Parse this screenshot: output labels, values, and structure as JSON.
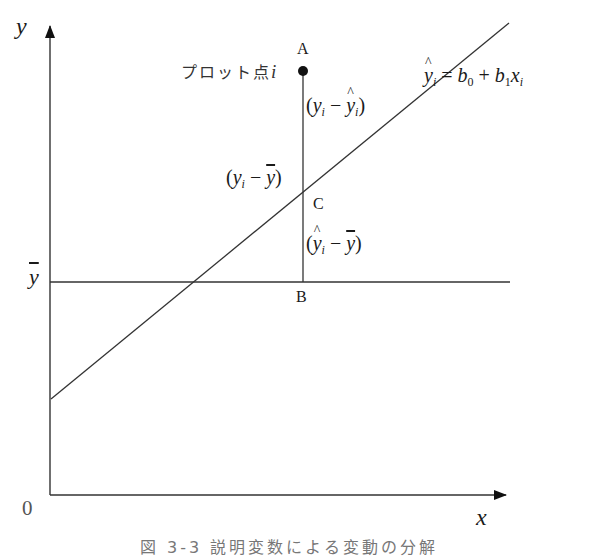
{
  "diagram": {
    "type": "regression-deviation-decomposition",
    "axes": {
      "x_label": "x",
      "y_label": "y",
      "origin_label": "0",
      "ybar_label": "y"
    },
    "points": {
      "A": "A",
      "B": "B",
      "C": "C"
    },
    "plot_point_label": {
      "text": "プロット点",
      "index": "i"
    },
    "deviations": {
      "residual": {
        "open": "(",
        "y": "y",
        "sub": "i",
        "minus": " − ",
        "yhat": "y",
        "sub2": "i",
        "close": ")"
      },
      "total": {
        "open": "(",
        "y": "y",
        "sub": "i",
        "minus": " − ",
        "ybar": "y",
        "close": ")"
      },
      "explained": {
        "open": "(",
        "yhat": "y",
        "sub": "i",
        "minus": " − ",
        "ybar": "y",
        "close": ")"
      }
    },
    "regression_equation": {
      "lhs": "y",
      "lhs_sub": "i",
      "eq": " = ",
      "b0": "b",
      "b0_sub": "0",
      "plus": " + ",
      "b1": "b",
      "b1_sub": "1",
      "x": "x",
      "x_sub": "i"
    },
    "caption": "図 3-3  説明変数による変動の分解"
  },
  "geometry": {
    "y_axis": {
      "x": 50,
      "y_top": 24,
      "y_bottom": 495
    },
    "x_axis": {
      "y": 495,
      "x_left": 50,
      "x_right": 508
    },
    "ybar_line": {
      "y": 282,
      "x_left": 50,
      "x_right": 510
    },
    "regression_line": {
      "x1": 51,
      "y1": 399,
      "x2": 509,
      "y2": 23
    },
    "vertical_segment": {
      "x": 303,
      "y_top": 71,
      "y_bottom": 282
    },
    "point_A": {
      "cx": 303,
      "cy": 71,
      "r": 5
    },
    "line_color": "#333333"
  }
}
